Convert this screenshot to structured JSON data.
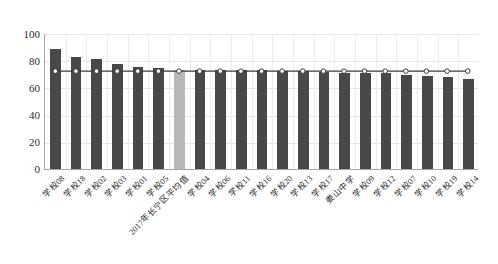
{
  "chart_data": {
    "type": "bar",
    "title": "",
    "subtitle": "",
    "xlabel": "",
    "ylabel": "",
    "ylim": [
      0,
      100
    ],
    "yticks": [
      0,
      20,
      40,
      60,
      80,
      100
    ],
    "grid": true,
    "legend": "none",
    "categories": [
      "学校08",
      "学校18",
      "学校02",
      "学校03",
      "学校01",
      "学校05",
      "2017年长宁区平均值",
      "学校04",
      "学校06",
      "学校11",
      "学校16",
      "学校20",
      "学校13",
      "学校17",
      "娄山中学",
      "学校09",
      "学校12",
      "学校07",
      "学校10",
      "学校19",
      "学校14"
    ],
    "series": [
      {
        "name": "各校得分",
        "type": "bar",
        "values": [
          88,
          82,
          81,
          77,
          75,
          74.5,
          73,
          72.5,
          72.5,
          72.5,
          72.5,
          72,
          72,
          71,
          70.5,
          70.5,
          70.5,
          69,
          68.5,
          68,
          66
        ],
        "color": "#484848",
        "highlight_index": 6,
        "highlight_color": "#b8b8b8"
      },
      {
        "name": "区平均线",
        "type": "line",
        "values": [
          72.5,
          72.5,
          72.5,
          72.5,
          72.5,
          72.5,
          72.5,
          72.5,
          72.5,
          72.5,
          72.5,
          72.5,
          72.5,
          72.5,
          72.5,
          72.5,
          72.5,
          72.5,
          72.5,
          72.5,
          72.5
        ],
        "color": "#3a3a3a",
        "marker": "circle-open",
        "marker_fill": "#ffffff"
      }
    ]
  }
}
